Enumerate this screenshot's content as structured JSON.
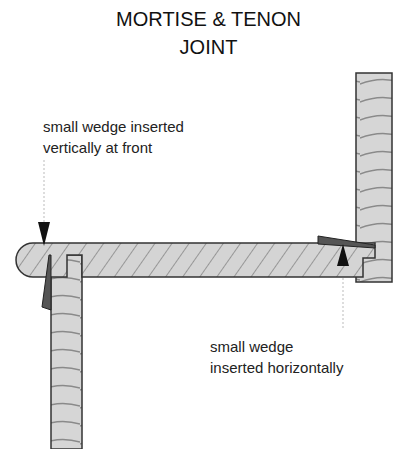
{
  "title": {
    "line1": "MORTISE & TENON",
    "line2": "JOINT"
  },
  "annotations": [
    {
      "id": "front-wedge",
      "line1": "small wedge inserted",
      "line2": "vertically at front"
    },
    {
      "id": "side-wedge",
      "line1": "small wedge",
      "line2": "inserted horizontally"
    }
  ],
  "colors": {
    "wood_fill": "#d4d4d4",
    "outline": "#333333",
    "grain": "#888888",
    "wedge_fill": "#555555",
    "arrow": "#111111",
    "leader": "#bbbbbb"
  },
  "parts": {
    "horizontal_board": "horizontal-board",
    "left_leg": "left-leg",
    "right_post": "right-post",
    "front_wedge": "front-wedge",
    "side_wedge": "side-wedge"
  }
}
